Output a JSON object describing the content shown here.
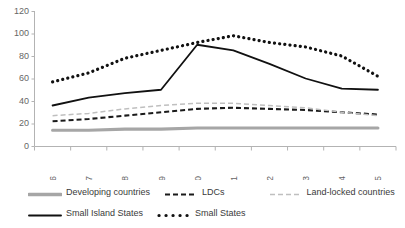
{
  "chart_data": {
    "type": "line",
    "title": "",
    "xlabel": "",
    "ylabel": "",
    "grid": false,
    "legend_position": "bottom",
    "ylim": [
      0,
      120
    ],
    "yticks": [
      0,
      20,
      40,
      60,
      80,
      100,
      120
    ],
    "categories": [
      "2006",
      "2007",
      "2008",
      "2009",
      "2010",
      "2011",
      "2012",
      "2013",
      "2014",
      "2015"
    ],
    "series": [
      {
        "name": "Developing countries",
        "style": "solid-thick-gray",
        "color": "#a6a6a6",
        "values": [
          14,
          14,
          15,
          15,
          16,
          16,
          16,
          16,
          16,
          16
        ]
      },
      {
        "name": "LDCs",
        "style": "dashed-bold-black",
        "color": "#1a1a1a",
        "values": [
          22,
          24,
          27,
          30,
          33,
          34,
          33,
          32,
          30,
          28
        ]
      },
      {
        "name": "Land-locked countries",
        "style": "dashed-light-gray",
        "color": "#bfbfbf",
        "values": [
          27,
          29,
          33,
          36,
          38,
          38,
          36,
          34,
          30,
          27
        ]
      },
      {
        "name": "Small Island States",
        "style": "solid-black",
        "color": "#111111",
        "values": [
          36,
          43,
          47,
          50,
          90,
          85,
          73,
          60,
          51,
          50
        ]
      },
      {
        "name": "Small States",
        "style": "dotted-black",
        "color": "#111111",
        "values": [
          57,
          65,
          78,
          85,
          92,
          98,
          92,
          88,
          80,
          62
        ]
      }
    ]
  },
  "axes": {
    "y_tick_labels": [
      "0",
      "20",
      "40",
      "60",
      "80",
      "100",
      "120"
    ],
    "x_tick_labels": [
      "2006",
      "2007",
      "2008",
      "2009",
      "2010",
      "2011",
      "2012",
      "2013",
      "2014",
      "2015"
    ]
  },
  "legend": {
    "items": [
      {
        "label": "Developing countries",
        "swatch": "solid-thick-gray-swatch"
      },
      {
        "label": "LDCs",
        "swatch": "dashed-bold-black-swatch"
      },
      {
        "label": "Land-locked countries",
        "swatch": "dashed-light-gray-swatch"
      },
      {
        "label": "Small Island States",
        "swatch": "solid-black-swatch"
      },
      {
        "label": "Small States",
        "swatch": "dotted-black-swatch"
      }
    ]
  }
}
